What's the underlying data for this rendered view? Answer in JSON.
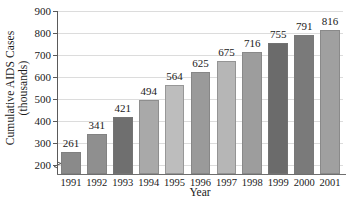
{
  "chart_data": {
    "type": "bar",
    "title": "",
    "subtitle": "",
    "xlabel": "Year",
    "ylabel_line1": "Cumulative AIDS Cases",
    "ylabel_line2": "(thousands)",
    "categories": [
      "1991",
      "1992",
      "1993",
      "1994",
      "1995",
      "1996",
      "1997",
      "1998",
      "1999",
      "2000",
      "2001"
    ],
    "values": [
      261,
      341,
      421,
      494,
      564,
      625,
      675,
      716,
      755,
      791,
      816
    ],
    "value_labels": [
      "261",
      "341",
      "421",
      "494",
      "564",
      "625",
      "675",
      "716",
      "755",
      "791",
      "816"
    ],
    "ylim": [
      160,
      900
    ],
    "yticks": [
      200,
      300,
      400,
      500,
      600,
      700,
      800,
      900
    ],
    "ytick_labels": [
      "200",
      "300",
      "400",
      "500",
      "600",
      "700",
      "800",
      "900"
    ],
    "grid": "horizontal",
    "legend": "none",
    "axis_break": true,
    "bar_colors": [
      "#8a8a8a",
      "#8f8f8f",
      "#6f6f6f",
      "#a9a9a9",
      "#bdbdbd",
      "#9a9a9a",
      "#b6b6b6",
      "#9d9d9d",
      "#6b6b6b",
      "#7a7a7a",
      "#a0a0a0"
    ],
    "colors": {
      "axis": "#5a5a5a",
      "grid": "#dcdcdc",
      "text": "#1a1a1a",
      "background": "#ffffff"
    }
  }
}
